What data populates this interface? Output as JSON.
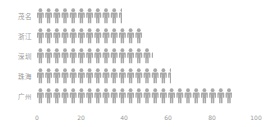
{
  "chart_data": {
    "type": "bar",
    "subtype": "pictorial-horizontal-bar",
    "title": "",
    "xlabel": "",
    "ylabel": "",
    "categories": [
      "茂名",
      "浙江",
      "深圳",
      "珠海",
      "广州"
    ],
    "values": [
      39,
      48,
      53,
      61,
      89
    ],
    "xlim": [
      0,
      100
    ],
    "xticks": [
      0,
      20,
      40,
      60,
      80,
      100
    ],
    "grid": false,
    "legend": null,
    "symbol": "person-icon",
    "symbol_color": "#a9a9a9"
  },
  "axis": {
    "tick_labels": [
      "0",
      "20",
      "40",
      "60",
      "80",
      "100"
    ]
  },
  "rows": [
    {
      "label": "茂名",
      "value": 39
    },
    {
      "label": "浙江",
      "value": 48
    },
    {
      "label": "深圳",
      "value": 53
    },
    {
      "label": "珠海",
      "value": 61
    },
    {
      "label": "广州",
      "value": 89
    }
  ],
  "colors": {
    "icon": "#a9a9a9",
    "text": "#9a9a9a",
    "background": "#ffffff"
  }
}
